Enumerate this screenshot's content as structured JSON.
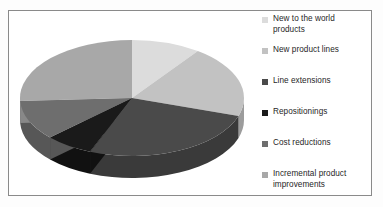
{
  "figure": {
    "background_color": "#ffffff",
    "border_color": "#8a8a8a"
  },
  "legend": {
    "position": "right",
    "entries": [
      {
        "label": "New to the world\nproducts",
        "color": "#dcdcdc",
        "swatch_name": "legend-swatch-new-to-the-world-products"
      },
      {
        "label": "New product lines",
        "color": "#c2c2c2",
        "swatch_name": "legend-swatch-new-product-lines"
      },
      {
        "label": "Line extensions",
        "color": "#4a4a4a",
        "swatch_name": "legend-swatch-line-extensions"
      },
      {
        "label": "Repositionings",
        "color": "#1a1a1a",
        "swatch_name": "legend-swatch-repositionings"
      },
      {
        "label": "Cost reductions",
        "color": "#6e6e6e",
        "swatch_name": "legend-swatch-cost-reductions"
      },
      {
        "label": "Incremental product\nimprovements",
        "color": "#a8a8a8",
        "swatch_name": "legend-swatch-incremental-product-improvements"
      }
    ]
  },
  "chart_data": {
    "type": "pie",
    "title": "",
    "subtitle": "",
    "xlabel": "",
    "ylabel": "",
    "three_d": true,
    "start_angle_deg": 0,
    "direction": "clockwise",
    "grid": false,
    "legend_position": "right",
    "categories": [
      "New to the world products",
      "New product lines",
      "Line extensions",
      "Repositionings",
      "Cost reductions",
      "Incremental product improvements"
    ],
    "values": [
      10,
      20,
      26,
      7,
      11,
      26
    ],
    "units": "percent",
    "colors": [
      "#dcdcdc",
      "#c2c2c2",
      "#4a4a4a",
      "#1a1a1a",
      "#6e6e6e",
      "#a8a8a8"
    ],
    "side_colors": [
      "#b4b4b4",
      "#9c9c9c",
      "#3a3a3a",
      "#111111",
      "#575757",
      "#888888"
    ],
    "slices": [
      {
        "name": "New to the world products",
        "value": 10,
        "color": "#dcdcdc",
        "start_deg": 0,
        "end_deg": 36
      },
      {
        "name": "New product lines",
        "value": 20,
        "color": "#c2c2c2",
        "start_deg": 36,
        "end_deg": 108
      },
      {
        "name": "Line extensions",
        "value": 26,
        "color": "#4a4a4a",
        "start_deg": 108,
        "end_deg": 202
      },
      {
        "name": "Repositionings",
        "value": 7,
        "color": "#1a1a1a",
        "start_deg": 202,
        "end_deg": 227
      },
      {
        "name": "Cost reductions",
        "value": 11,
        "color": "#6e6e6e",
        "start_deg": 227,
        "end_deg": 267
      },
      {
        "name": "Incremental product improvements",
        "value": 26,
        "color": "#a8a8a8",
        "start_deg": 267,
        "end_deg": 360
      }
    ],
    "annotations": []
  }
}
